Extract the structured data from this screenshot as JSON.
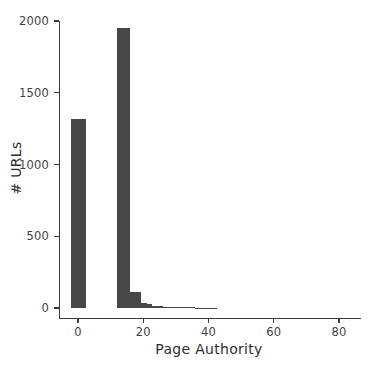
{
  "chart_data": {
    "type": "bar",
    "title": "",
    "subtitle": "",
    "xlabel": "Page Authority",
    "ylabel": "# URLs",
    "xlim": [
      -4,
      88
    ],
    "ylim": [
      0,
      2070
    ],
    "grid": false,
    "legend": null,
    "bar_color": "#474747",
    "bin_width": 1.6,
    "xticks": [
      0,
      20,
      40,
      60,
      80
    ],
    "xticklabels": [
      "0",
      "20",
      "40",
      "60",
      "80"
    ],
    "yticks": [
      0,
      500,
      1000,
      1500,
      2000
    ],
    "yticklabels": [
      "0",
      "500",
      "1000",
      "1500",
      "2000"
    ],
    "x": [
      -1.6,
      0.0,
      1.6,
      3.2,
      4.8,
      6.4,
      8.0,
      9.6,
      11.2,
      12.8,
      14.4,
      16.0,
      17.6,
      19.2,
      20.8,
      22.4,
      24.0,
      25.6,
      27.2,
      28.8,
      30.4,
      32.0,
      33.6,
      35.2,
      36.8,
      38.4,
      40.0,
      41.6,
      43.2,
      44.8,
      46.4,
      48.0,
      49.6,
      51.2,
      52.8,
      54.4,
      56.0,
      57.6,
      59.2,
      60.8,
      62.4,
      64.0,
      65.6,
      67.2,
      68.8,
      70.4,
      72.0,
      73.6,
      75.2,
      76.8,
      78.4,
      80.0,
      81.6,
      83.2
    ],
    "values": [
      0,
      1320,
      0,
      0,
      0,
      0,
      0,
      0,
      0,
      1950,
      1950,
      115,
      115,
      30,
      28,
      12,
      10,
      9,
      8,
      8,
      6,
      4,
      3,
      3,
      2,
      2,
      2,
      1,
      1,
      0,
      0,
      0,
      0,
      0,
      0,
      0,
      0,
      0,
      0,
      0,
      0,
      0,
      0,
      0,
      0,
      0,
      0,
      0,
      0,
      0,
      0,
      0,
      0,
      0
    ],
    "bars": [
      {
        "x0": -2.0,
        "x1": 2.6,
        "height": 1320
      },
      {
        "x0": 12.1,
        "x1": 15.9,
        "height": 1950
      },
      {
        "x0": 15.9,
        "x1": 17.6,
        "height": 115
      },
      {
        "x0": 17.6,
        "x1": 19.3,
        "height": 112
      },
      {
        "x0": 19.3,
        "x1": 21.0,
        "height": 32
      },
      {
        "x0": 21.0,
        "x1": 22.6,
        "height": 26
      },
      {
        "x0": 22.6,
        "x1": 24.3,
        "height": 14
      },
      {
        "x0": 24.3,
        "x1": 26.0,
        "height": 11
      },
      {
        "x0": 26.0,
        "x1": 27.6,
        "height": 10
      },
      {
        "x0": 27.6,
        "x1": 29.3,
        "height": 10
      },
      {
        "x0": 29.3,
        "x1": 31.0,
        "height": 8
      },
      {
        "x0": 31.0,
        "x1": 32.6,
        "height": 6
      },
      {
        "x0": 32.6,
        "x1": 34.3,
        "height": 5
      },
      {
        "x0": 34.3,
        "x1": 36.0,
        "height": 4
      },
      {
        "x0": 36.0,
        "x1": 37.6,
        "height": 3
      },
      {
        "x0": 37.6,
        "x1": 39.3,
        "height": 3
      },
      {
        "x0": 39.3,
        "x1": 41.0,
        "height": 2
      },
      {
        "x0": 41.0,
        "x1": 42.6,
        "height": 2
      }
    ]
  }
}
